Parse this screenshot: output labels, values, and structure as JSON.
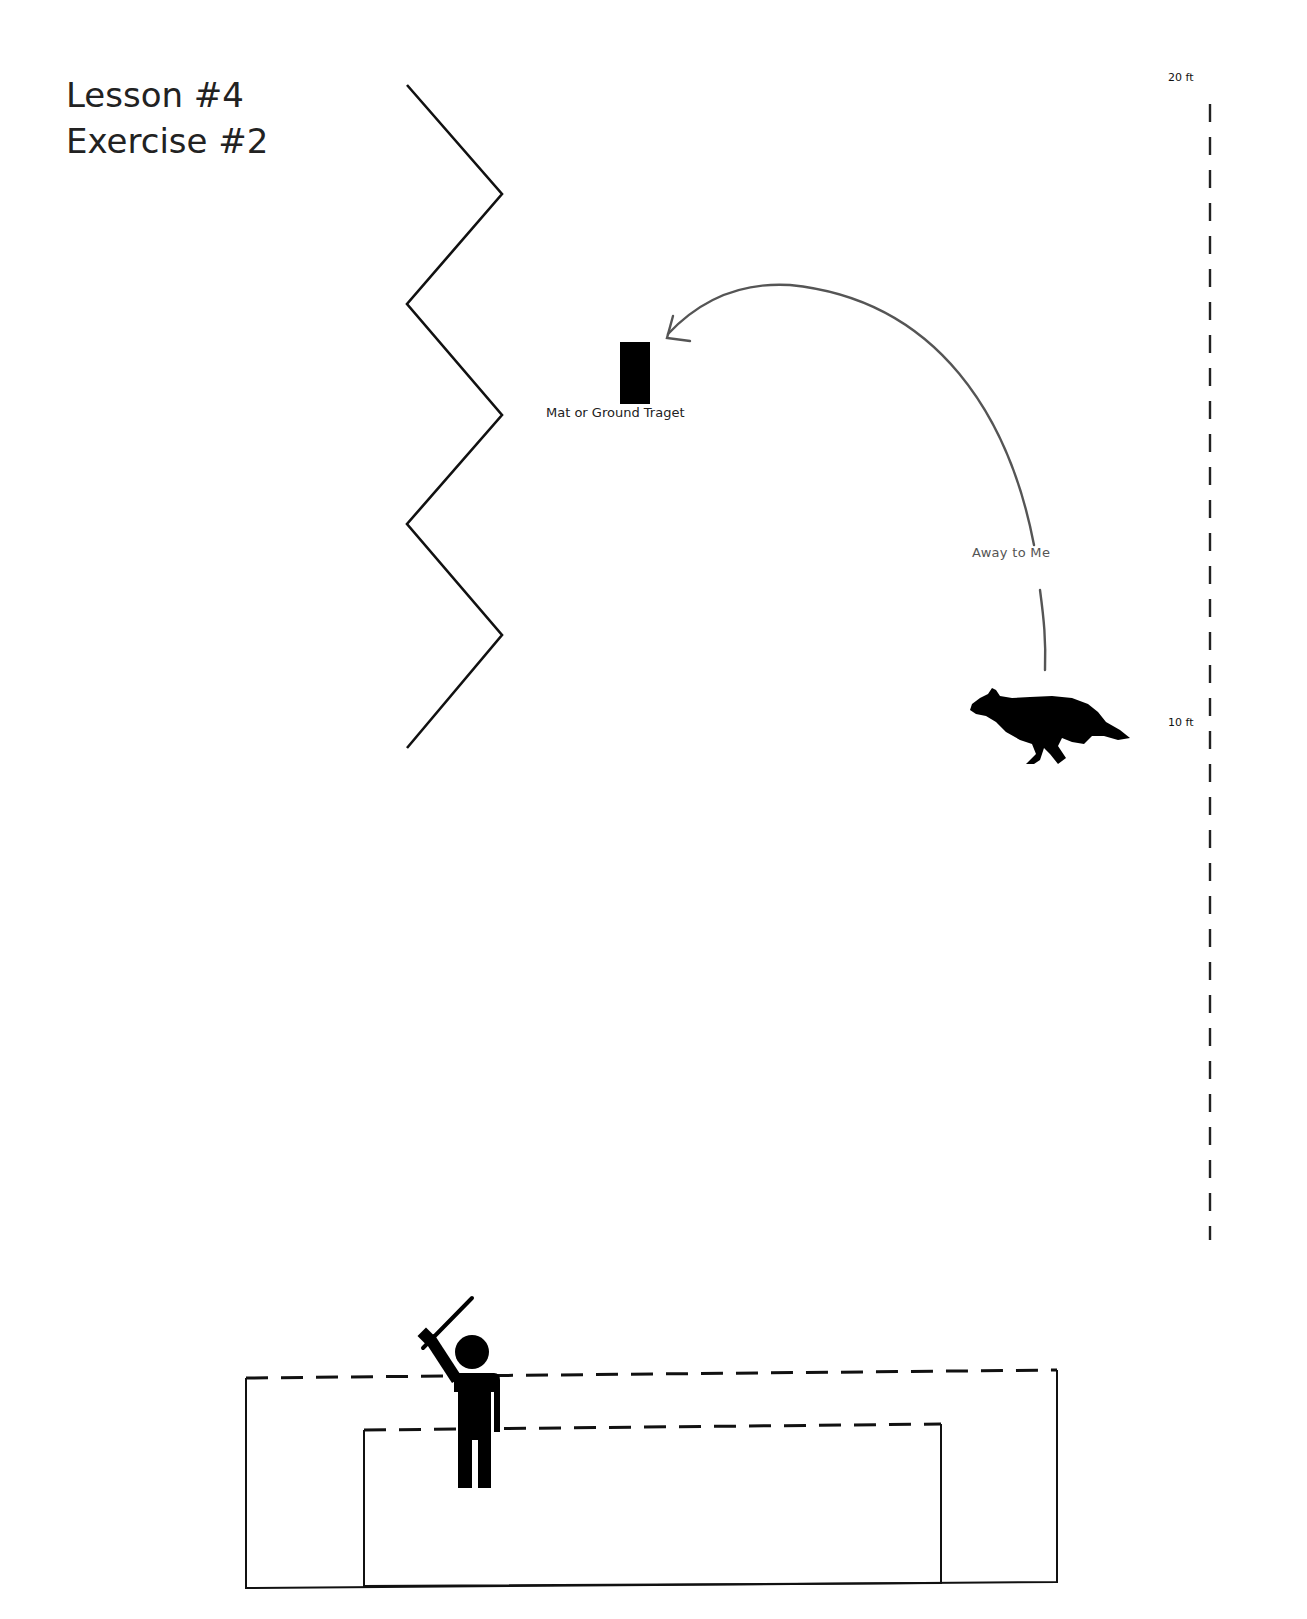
{
  "header": {
    "lesson": "Lesson #4",
    "exercise": "Exercise #2"
  },
  "field": {
    "target": {
      "label": "Mat or Ground Traget",
      "color": "#000000"
    },
    "command": {
      "label": "Away to Me",
      "path_color": "#555555"
    },
    "dog": {
      "icon": "dog-silhouette-icon",
      "direction": "left"
    },
    "fence": {
      "type": "zigzag",
      "color": "#111111"
    },
    "handler": {
      "icon": "handler-with-stick-icon"
    },
    "pens": {
      "outer": "dashed-top rectangle",
      "inner": "dashed-top rectangle"
    }
  },
  "scale": {
    "top_label": "20 ft",
    "mid_label": "10 ft"
  }
}
